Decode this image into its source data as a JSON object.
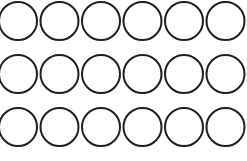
{
  "figure": {
    "background_color": "#ffffff",
    "width": 247,
    "height": 161
  },
  "grid": {
    "columns": 6,
    "rows": 3,
    "total_circles": 18,
    "circle_diameter": 38,
    "stroke_color": "#231f20",
    "stroke_width": 2,
    "fill_color": "none",
    "column_pitch": 41.5,
    "row_pitch": 53,
    "first_center_x": 18,
    "first_center_y": 21,
    "clipped_edges": [
      "top",
      "left"
    ],
    "shape_name": "circle",
    "circles": [
      {
        "id": "r1c1",
        "row": 1,
        "col": 1,
        "cx": 18,
        "cy": 21,
        "r": 19
      },
      {
        "id": "r1c2",
        "row": 1,
        "col": 2,
        "cx": 59.5,
        "cy": 21,
        "r": 19
      },
      {
        "id": "r1c3",
        "row": 1,
        "col": 3,
        "cx": 101,
        "cy": 21,
        "r": 19
      },
      {
        "id": "r1c4",
        "row": 1,
        "col": 4,
        "cx": 142.5,
        "cy": 21,
        "r": 19
      },
      {
        "id": "r1c5",
        "row": 1,
        "col": 5,
        "cx": 184,
        "cy": 21,
        "r": 19
      },
      {
        "id": "r1c6",
        "row": 1,
        "col": 6,
        "cx": 225.5,
        "cy": 21,
        "r": 19
      },
      {
        "id": "r2c1",
        "row": 2,
        "col": 1,
        "cx": 18,
        "cy": 74,
        "r": 19
      },
      {
        "id": "r2c2",
        "row": 2,
        "col": 2,
        "cx": 59.5,
        "cy": 74,
        "r": 19
      },
      {
        "id": "r2c3",
        "row": 2,
        "col": 3,
        "cx": 101,
        "cy": 74,
        "r": 19
      },
      {
        "id": "r2c4",
        "row": 2,
        "col": 4,
        "cx": 142.5,
        "cy": 74,
        "r": 19
      },
      {
        "id": "r2c5",
        "row": 2,
        "col": 5,
        "cx": 184,
        "cy": 74,
        "r": 19
      },
      {
        "id": "r2c6",
        "row": 2,
        "col": 6,
        "cx": 225.5,
        "cy": 74,
        "r": 19
      },
      {
        "id": "r3c1",
        "row": 3,
        "col": 1,
        "cx": 18,
        "cy": 127,
        "r": 19
      },
      {
        "id": "r3c2",
        "row": 3,
        "col": 2,
        "cx": 59.5,
        "cy": 127,
        "r": 19
      },
      {
        "id": "r3c3",
        "row": 3,
        "col": 3,
        "cx": 101,
        "cy": 127,
        "r": 19
      },
      {
        "id": "r3c4",
        "row": 3,
        "col": 4,
        "cx": 142.5,
        "cy": 127,
        "r": 19
      },
      {
        "id": "r3c5",
        "row": 3,
        "col": 5,
        "cx": 184,
        "cy": 127,
        "r": 19
      },
      {
        "id": "r3c6",
        "row": 3,
        "col": 6,
        "cx": 225.5,
        "cy": 127,
        "r": 19
      }
    ]
  }
}
